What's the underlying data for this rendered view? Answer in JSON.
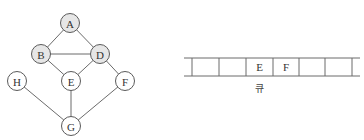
{
  "graph": {
    "colors": {
      "visited_fill": "#e6e6e6",
      "unvisited_fill": "#ffffff"
    },
    "nodes": [
      {
        "id": "A",
        "label": "A",
        "x": 70,
        "y": 23,
        "visited": true
      },
      {
        "id": "B",
        "label": "B",
        "x": 41,
        "y": 54,
        "visited": true
      },
      {
        "id": "D",
        "label": "D",
        "x": 100,
        "y": 54,
        "visited": true
      },
      {
        "id": "H",
        "label": "H",
        "x": 17,
        "y": 81,
        "visited": false
      },
      {
        "id": "E",
        "label": "E",
        "x": 71,
        "y": 81,
        "visited": false
      },
      {
        "id": "F",
        "label": "F",
        "x": 125,
        "y": 81,
        "visited": false
      },
      {
        "id": "G",
        "label": "G",
        "x": 71,
        "y": 126,
        "visited": false
      }
    ],
    "edges": [
      [
        "A",
        "B"
      ],
      [
        "A",
        "D"
      ],
      [
        "B",
        "D"
      ],
      [
        "B",
        "E"
      ],
      [
        "D",
        "E"
      ],
      [
        "D",
        "F"
      ],
      [
        "H",
        "G"
      ],
      [
        "E",
        "G"
      ],
      [
        "F",
        "G"
      ]
    ]
  },
  "queue": {
    "caption": "큐",
    "cells": [
      "",
      "",
      "E",
      "F",
      "",
      "",
      ""
    ]
  }
}
